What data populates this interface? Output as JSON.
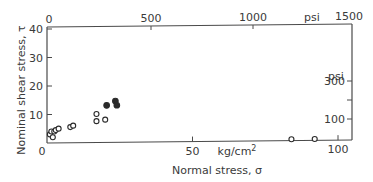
{
  "chart_data": {
    "type": "scatter",
    "title": "",
    "xlabel": "Normal stress, σ",
    "ylabel": "Nominal shear stress, τ",
    "x_unit": "kg/cm²",
    "y_unit": "",
    "xlim": [
      0,
      105
    ],
    "ylim": [
      0,
      40
    ],
    "x_ticks": [
      {
        "value": 50,
        "label": "50"
      },
      {
        "value": 100,
        "label": "100"
      }
    ],
    "x_origin_label": "0",
    "y_ticks": [
      {
        "value": 10,
        "label": "10"
      },
      {
        "value": 20,
        "label": "20"
      },
      {
        "value": 30,
        "label": "30"
      },
      {
        "value": 40,
        "label": "40"
      }
    ],
    "secondary_x_axis": {
      "position": "top",
      "unit": "psi",
      "range": [
        0,
        1500
      ],
      "ticks": [
        {
          "value": 0,
          "label": "0"
        },
        {
          "value": 500,
          "label": "500"
        },
        {
          "value": 1000,
          "label": "1000"
        },
        {
          "value": 1500,
          "label": "1500"
        }
      ]
    },
    "secondary_y_axis": {
      "position": "right",
      "unit": "psi",
      "ticks": [
        {
          "value": 100,
          "label": "100"
        },
        {
          "value": 200,
          "label": ""
        },
        {
          "value": 300,
          "label": "300"
        }
      ]
    },
    "grid": false,
    "legend": null,
    "series": [
      {
        "name": "open circles",
        "marker": "open-circle",
        "points": [
          {
            "x": 1,
            "y": 3
          },
          {
            "x": 1.5,
            "y": 4
          },
          {
            "x": 2.5,
            "y": 4
          },
          {
            "x": 2,
            "y": 2
          },
          {
            "x": 3,
            "y": 4.5
          },
          {
            "x": 4,
            "y": 5
          },
          {
            "x": 8,
            "y": 5.5
          },
          {
            "x": 9,
            "y": 6
          },
          {
            "x": 17,
            "y": 10
          },
          {
            "x": 17,
            "y": 7.5
          },
          {
            "x": 20,
            "y": 8
          },
          {
            "x": 84,
            "y": 0.5
          },
          {
            "x": 92,
            "y": 0.5
          }
        ]
      },
      {
        "name": "filled circles",
        "marker": "filled-circle",
        "points": [
          {
            "x": 20.5,
            "y": 13
          },
          {
            "x": 23.5,
            "y": 14.5
          },
          {
            "x": 24,
            "y": 13
          }
        ]
      }
    ]
  },
  "labels": {
    "xlabel": "Normal stress, σ",
    "ylabel": "Nominal shear stress, τ",
    "x_unit": "kg/cm",
    "x_unit_sup": "2",
    "top_unit": "psi",
    "right_unit": "psi",
    "y_origin": "0"
  },
  "colors": {
    "axis": "#4a4a4a",
    "text": "#3a3a3a",
    "marker": "#2a2a2a"
  }
}
